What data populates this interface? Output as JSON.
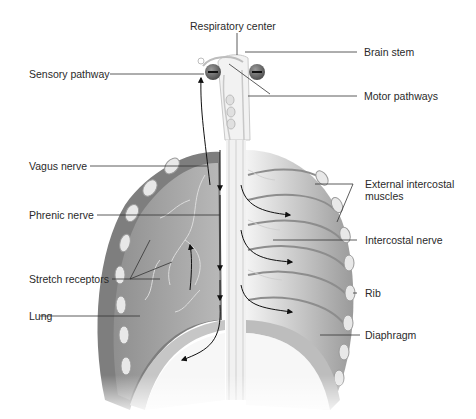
{
  "labels": {
    "respiratory_center": "Respiratory center",
    "brain_stem": "Brain stem",
    "sensory_pathway": "Sensory pathway",
    "motor_pathways": "Motor pathways",
    "vagus_nerve": "Vagus nerve",
    "phrenic_nerve": "Phrenic nerve",
    "stretch_receptors": "Stretch receptors",
    "lung": "Lung",
    "external_intercostal_muscles_line1": "External intercostal",
    "external_intercostal_muscles_line2": "muscles",
    "intercostal_nerve": "Intercostal nerve",
    "rib": "Rib",
    "diaphragm": "Diaphragm"
  },
  "symbols": {
    "inhibition_left": "−",
    "inhibition_right": "−"
  },
  "colors": {
    "lung_fill": "#a9a9a9",
    "muscle_fill": "#8c8c8c",
    "rib_fill": "#e6e6e6",
    "leader_line": "#333333",
    "inhibit_circle": "#6a6a6a"
  }
}
